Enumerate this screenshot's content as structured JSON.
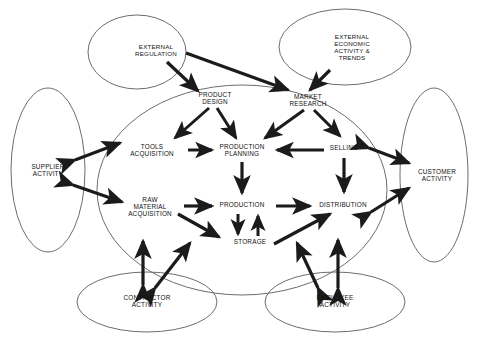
{
  "diagram": {
    "type": "influence-diagram",
    "colors": {
      "ellipse_stroke": "#6d6d6d",
      "arrow_fill": "#1b1b1b",
      "text": "#121212",
      "background": "#ffffff"
    },
    "environment_nodes": [
      {
        "id": "external-regulation",
        "label": "EXTERNAL\nREGULATION",
        "cx": 137,
        "cy": 52,
        "rx": 49,
        "ry": 37,
        "lx": 156,
        "ly": 51
      },
      {
        "id": "external-economic",
        "label": "EXTERNAL\nECONOMIC\nACTIVITY &\nTRENDS",
        "cx": 345,
        "cy": 47,
        "rx": 66,
        "ry": 38,
        "lx": 352,
        "ly": 48
      },
      {
        "id": "supplier-activity",
        "label": "SUPPLIER\nACTIVITY",
        "cx": 48,
        "cy": 170,
        "rx": 37,
        "ry": 82,
        "lx": 48,
        "ly": 170
      },
      {
        "id": "customer-activity",
        "label": "CUSTOMER\nACTIVITY",
        "cx": 434,
        "cy": 175,
        "rx": 34,
        "ry": 87,
        "lx": 437,
        "ly": 175
      },
      {
        "id": "contractor-activity",
        "label": "CONTRACTOR\nACTIVITY",
        "cx": 147,
        "cy": 302,
        "rx": 70,
        "ry": 30,
        "lx": 147,
        "ly": 301
      },
      {
        "id": "employee-activity",
        "label": "EMPLOYEE\nACTIVITY",
        "cx": 335,
        "cy": 302,
        "rx": 70,
        "ry": 30,
        "lx": 335,
        "ly": 301
      }
    ],
    "core_boundary": {
      "id": "organization-boundary",
      "cx": 242,
      "cy": 190,
      "rx": 145,
      "ry": 105
    },
    "core_nodes": [
      {
        "id": "product-design",
        "label": "PRODUCT\nDESIGN",
        "lx": 215,
        "ly": 98
      },
      {
        "id": "market-research",
        "label": "MARKET\nRESEARCH",
        "lx": 308,
        "ly": 100
      },
      {
        "id": "tools-acquisition",
        "label": "TOOLS\nACQUISITION",
        "lx": 152,
        "ly": 150
      },
      {
        "id": "production-planning",
        "label": "PRODUCTION\nPLANNING",
        "lx": 242,
        "ly": 150
      },
      {
        "id": "selling",
        "label": "SELLING",
        "lx": 344,
        "ly": 148
      },
      {
        "id": "raw-material-acquisition",
        "label": "RAW\nMATERIAL\nACQUISITION",
        "lx": 150,
        "ly": 207
      },
      {
        "id": "production",
        "label": "PRODUCTION",
        "lx": 242,
        "ly": 205
      },
      {
        "id": "distribution",
        "label": "DISTRIBUTION",
        "lx": 343,
        "ly": 205
      },
      {
        "id": "storage",
        "label": "STORAGE",
        "lx": 250,
        "ly": 242
      }
    ],
    "connections": [
      {
        "id": "regulation-to-product-design",
        "from": "external-regulation",
        "to": "product-design",
        "style": "single"
      },
      {
        "id": "regulation-to-market-research",
        "from": "external-regulation",
        "to": "market-research",
        "style": "single"
      },
      {
        "id": "economic-to-market-research",
        "from": "external-economic",
        "to": "market-research",
        "style": "single"
      },
      {
        "id": "product-design-to-tools",
        "from": "product-design",
        "to": "tools-acquisition",
        "style": "single"
      },
      {
        "id": "product-design-to-planning",
        "from": "product-design",
        "to": "production-planning",
        "style": "single"
      },
      {
        "id": "market-research-to-planning",
        "from": "market-research",
        "to": "production-planning",
        "style": "single"
      },
      {
        "id": "market-research-to-selling",
        "from": "market-research",
        "to": "selling",
        "style": "single"
      },
      {
        "id": "tools-to-planning",
        "from": "tools-acquisition",
        "to": "production-planning",
        "style": "single"
      },
      {
        "id": "selling-to-planning",
        "from": "selling",
        "to": "production-planning",
        "style": "single"
      },
      {
        "id": "planning-to-production",
        "from": "production-planning",
        "to": "production",
        "style": "single"
      },
      {
        "id": "selling-to-distribution",
        "from": "selling",
        "to": "distribution",
        "style": "single"
      },
      {
        "id": "raw-material-to-production",
        "from": "raw-material-acquisition",
        "to": "production",
        "style": "single"
      },
      {
        "id": "production-to-distribution",
        "from": "production",
        "to": "distribution",
        "style": "single"
      },
      {
        "id": "raw-material-to-storage",
        "from": "raw-material-acquisition",
        "to": "storage",
        "style": "single"
      },
      {
        "id": "production-to-storage",
        "from": "production",
        "to": "storage",
        "style": "single"
      },
      {
        "id": "storage-to-production",
        "from": "storage",
        "to": "production",
        "style": "single"
      },
      {
        "id": "storage-to-distribution",
        "from": "storage",
        "to": "distribution",
        "style": "single"
      },
      {
        "id": "supplier-tools-exchange",
        "from": "supplier-activity",
        "to": "tools-acquisition",
        "style": "double"
      },
      {
        "id": "supplier-raw-material-exchange",
        "from": "supplier-activity",
        "to": "raw-material-acquisition",
        "style": "double"
      },
      {
        "id": "selling-customer-exchange",
        "from": "selling",
        "to": "customer-activity",
        "style": "double"
      },
      {
        "id": "distribution-customer-exchange",
        "from": "distribution",
        "to": "customer-activity",
        "style": "double"
      },
      {
        "id": "contractor-vertical-exchange",
        "from": "contractor-activity",
        "to": "raw-material-acquisition",
        "style": "double"
      },
      {
        "id": "contractor-diagonal-exchange",
        "from": "contractor-activity",
        "to": "storage",
        "style": "double"
      },
      {
        "id": "employee-diagonal-exchange",
        "from": "employee-activity",
        "to": "storage",
        "style": "double"
      },
      {
        "id": "employee-vertical-exchange",
        "from": "employee-activity",
        "to": "distribution",
        "style": "double"
      }
    ]
  }
}
